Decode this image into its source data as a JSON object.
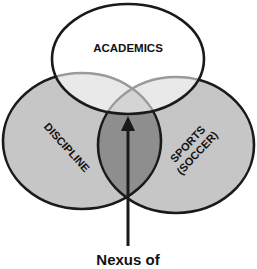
{
  "diagram": {
    "type": "venn",
    "sets": [
      {
        "id": "academics",
        "label": "ACADEMICS"
      },
      {
        "id": "discipline",
        "label": "DISCIPLINE"
      },
      {
        "id": "sports",
        "label": "SPORTS",
        "label_line2": "(SOCCER)"
      }
    ],
    "caption": "Nexus of",
    "colors": {
      "outline": "#1a1a1a",
      "inner_outline": "#9a9a9a",
      "side_fill": "#c4c4c4",
      "top_fill": "#ffffff",
      "center_fill": "#8f8f8f",
      "arrow": "#1a1a1a"
    }
  }
}
